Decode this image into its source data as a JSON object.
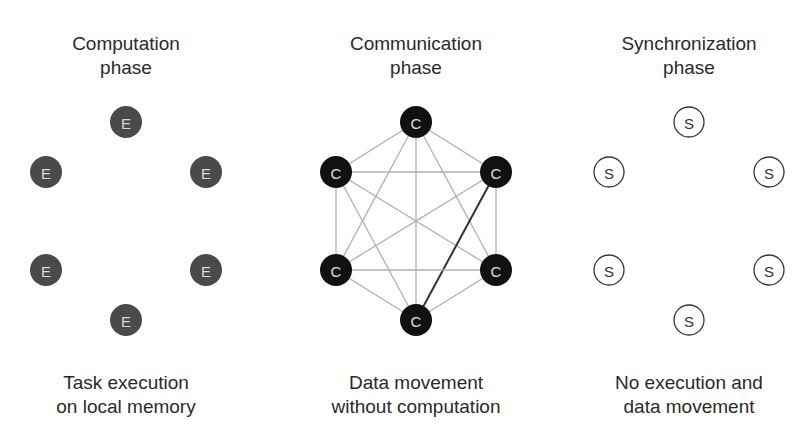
{
  "panels": [
    {
      "id": "computation",
      "title_line1": "Computation",
      "title_line2": "phase",
      "caption_line1": "Task execution",
      "caption_line2": "on local memory",
      "node_label": "E",
      "node_style": "gray-filled",
      "node_fill": "#4a4a4a",
      "label_color": "#d8d8d8",
      "edges": "none"
    },
    {
      "id": "communication",
      "title_line1": "Communication",
      "title_line2": "phase",
      "caption_line1": "Data movement",
      "caption_line2": "without computation",
      "node_label": "C",
      "node_style": "black-filled",
      "node_fill": "#111111",
      "label_color": "#e0e0e0",
      "edges": "complete-graph",
      "edge_color": "#b0b0b0",
      "highlight_edge": {
        "from": "upper-right",
        "to": "bottom",
        "color": "#333333"
      }
    },
    {
      "id": "synchronization",
      "title_line1": "Synchronization",
      "title_line2": "phase",
      "caption_line1": "No execution and",
      "caption_line2": "data movement",
      "node_label": "S",
      "node_style": "outlined",
      "node_fill": "#ffffff",
      "label_color": "#333333",
      "edges": "none"
    }
  ]
}
